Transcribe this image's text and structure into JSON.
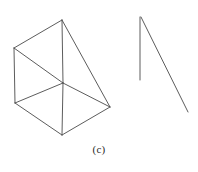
{
  "figure": {
    "caption": "(c)",
    "background_color": "#ffffff",
    "stroke_color": "#4a4a4a",
    "stroke_width": 0.9,
    "canvas": {
      "width": 198,
      "height": 172
    },
    "objects": [
      {
        "name": "wireframe-prism",
        "type": "line-drawing",
        "description": "Transparent wireframe of an oblique prism / folded box seen in perspective",
        "vertices": {
          "apex_top": [
            62,
            20
          ],
          "upper_left": [
            14,
            48
          ],
          "center": [
            63,
            83
          ],
          "right": [
            110,
            107
          ],
          "lower_left": [
            15,
            103
          ],
          "bottom": [
            62,
            135
          ]
        },
        "edges": [
          {
            "name": "edge-apex-to-upper-left",
            "from": [
              62,
              20
            ],
            "to": [
              14,
              48
            ]
          },
          {
            "name": "edge-upper-left-to-center",
            "from": [
              14,
              48
            ],
            "to": [
              63,
              83
            ]
          },
          {
            "name": "edge-apex-to-center",
            "from": [
              62,
              20
            ],
            "to": [
              63,
              83
            ]
          },
          {
            "name": "edge-apex-to-right",
            "from": [
              62,
              20
            ],
            "to": [
              110,
              107
            ]
          },
          {
            "name": "edge-center-to-right",
            "from": [
              63,
              83
            ],
            "to": [
              110,
              107
            ]
          },
          {
            "name": "edge-upper-left-to-lower-left",
            "from": [
              14,
              48
            ],
            "to": [
              15,
              103
            ]
          },
          {
            "name": "edge-center-to-lower-left",
            "from": [
              63,
              83
            ],
            "to": [
              15,
              103
            ]
          },
          {
            "name": "edge-lower-left-to-bottom",
            "from": [
              15,
              103
            ],
            "to": [
              62,
              135
            ]
          },
          {
            "name": "edge-center-to-bottom",
            "from": [
              63,
              83
            ],
            "to": [
              62,
              135
            ]
          },
          {
            "name": "edge-bottom-to-right",
            "from": [
              62,
              135
            ],
            "to": [
              110,
              107
            ]
          }
        ]
      },
      {
        "name": "open-wedge",
        "type": "line-drawing",
        "description": "Two straight strokes meeting at a top apex forming a narrow open wedge",
        "vertices": {
          "apex": [
            140,
            17
          ],
          "vertical_end": [
            140,
            80
          ],
          "diagonal_end": [
            188,
            112
          ]
        },
        "edges": [
          {
            "name": "edge-vertical-stroke",
            "from": [
              140,
              17
            ],
            "to": [
              140,
              80
            ]
          },
          {
            "name": "edge-diagonal-stroke",
            "from": [
              141,
              17
            ],
            "to": [
              188,
              112
            ]
          }
        ]
      }
    ]
  }
}
